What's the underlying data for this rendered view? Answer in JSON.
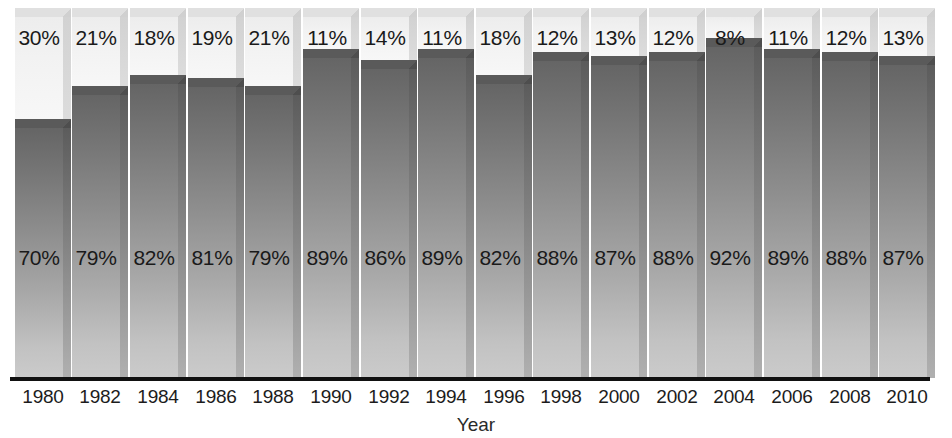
{
  "chart_data": {
    "type": "bar",
    "subtype": "stacked-100-percent-3d",
    "title": "",
    "subtitle": "",
    "xlabel": "Year",
    "ylabel": "",
    "ylim": [
      0,
      100
    ],
    "grid": false,
    "legend": null,
    "categories": [
      "1980",
      "1982",
      "1984",
      "1986",
      "1988",
      "1990",
      "1992",
      "1994",
      "1996",
      "1998",
      "2000",
      "2002",
      "2004",
      "2006",
      "2008",
      "2010"
    ],
    "series": [
      {
        "name": "lower-segment",
        "color": "#8e8e8e",
        "values": [
          70,
          79,
          82,
          81,
          79,
          89,
          86,
          89,
          82,
          88,
          87,
          88,
          92,
          89,
          88,
          87
        ],
        "labels": [
          "70%",
          "79%",
          "82%",
          "81%",
          "79%",
          "89%",
          "86%",
          "89%",
          "82%",
          "88%",
          "87%",
          "88%",
          "92%",
          "89%",
          "88%",
          "87%"
        ]
      },
      {
        "name": "upper-segment",
        "color": "#f0f0f0",
        "values": [
          30,
          21,
          18,
          19,
          21,
          11,
          14,
          11,
          18,
          12,
          13,
          12,
          8,
          11,
          12,
          13
        ],
        "labels": [
          "30%",
          "21%",
          "18%",
          "19%",
          "21%",
          "11%",
          "14%",
          "11%",
          "18%",
          "12%",
          "13%",
          "12%",
          "8%",
          "11%",
          "12%",
          "13%"
        ]
      }
    ]
  },
  "axis": {
    "title": "Year"
  },
  "colors": {
    "upper_segment": "#f0f0f0",
    "lower_segment": "#8e8e8e",
    "lower_segment_top": "#656565",
    "lower_segment_bottom": "#cbcbcb",
    "axis_line": "#111111",
    "label_text": "#1a1a1a",
    "background": "#ffffff"
  }
}
